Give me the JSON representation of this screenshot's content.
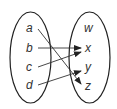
{
  "diagram": {
    "type": "mapping-diagram",
    "domain_set": {
      "elements": [
        "a",
        "b",
        "c",
        "d"
      ]
    },
    "codomain_set": {
      "elements": [
        "w",
        "x",
        "y",
        "z"
      ]
    },
    "mappings": [
      {
        "from": "a",
        "to": "z"
      },
      {
        "from": "b",
        "to": "x"
      },
      {
        "from": "c",
        "to": "x"
      },
      {
        "from": "d",
        "to": "y"
      }
    ],
    "colors": {
      "stroke": "#222222",
      "text": "#333333",
      "background": "#ffffff"
    }
  }
}
